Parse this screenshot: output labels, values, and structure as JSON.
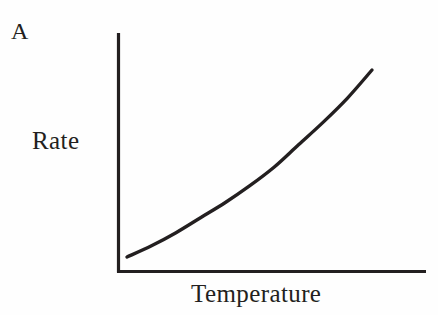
{
  "figure": {
    "panel_label": "A",
    "background_color": "#fefefe",
    "ink_color": "#231f20",
    "width": 438,
    "height": 315
  },
  "chart_data": {
    "type": "line",
    "title": "A",
    "xlabel": "Temperature",
    "ylabel": "Rate",
    "grid": false,
    "legend": false,
    "axis_ticks": false,
    "axis_tick_labels": false,
    "xlim": [
      0,
      1
    ],
    "ylim": [
      0,
      1
    ],
    "annotations": [
      "A"
    ],
    "series": [
      {
        "name": "Rate vs Temperature",
        "description": "Monotonically increasing, upward-curving (exponential-like) relationship with no tick marks or numeric scale",
        "color": "#231f20",
        "line_width": 3.4,
        "x": [
          0.0,
          0.1,
          0.2,
          0.3,
          0.4,
          0.5,
          0.6,
          0.7,
          0.8,
          0.9,
          1.0
        ],
        "y": [
          0.0,
          0.06,
          0.13,
          0.21,
          0.29,
          0.38,
          0.48,
          0.6,
          0.72,
          0.85,
          1.0
        ]
      }
    ]
  },
  "axes": {
    "y_axis_name": "rate-axis",
    "x_axis_name": "temperature-axis",
    "line_color": "#231f20"
  }
}
